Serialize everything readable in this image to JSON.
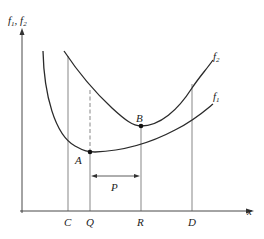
{
  "diagram": {
    "y_axis_label": "f",
    "y_axis_label_sub1": "1",
    "y_axis_label_sep": ", f",
    "y_axis_label_sub2": "2",
    "x_axis_label": "x",
    "curves": [
      {
        "name": "f",
        "sub": "1",
        "description": "lower U-shaped curve with minimum at A"
      },
      {
        "name": "f",
        "sub": "2",
        "description": "upper U-shaped curve with minimum at B"
      }
    ],
    "points": [
      {
        "label": "A",
        "x_tick": "Q"
      },
      {
        "label": "B",
        "x_tick": "R"
      }
    ],
    "x_ticks": [
      "C",
      "Q",
      "R",
      "D"
    ],
    "interval_label": "P",
    "colors": {
      "line": "#2a2a2a",
      "text": "#222222",
      "background": "#ffffff"
    }
  }
}
